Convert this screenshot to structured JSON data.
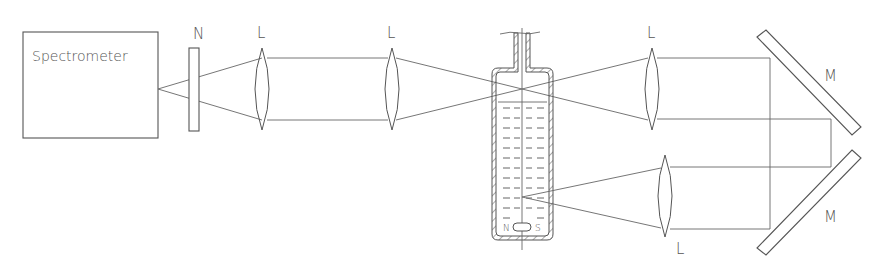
{
  "diagram": {
    "components": {
      "spectrometer": {
        "label": "Spectrometer"
      },
      "filter": {
        "label": "N"
      },
      "lens_1": {
        "label": "L"
      },
      "lens_2": {
        "label": "L"
      },
      "lens_3": {
        "label": "L"
      },
      "lens_4": {
        "label": "L"
      },
      "mirror_top": {
        "label": "M"
      },
      "mirror_bottom": {
        "label": "M"
      },
      "cell": {
        "magnet_north": "N",
        "magnet_south": "S"
      }
    },
    "colors": {
      "stroke": "#555555",
      "background": "#ffffff"
    }
  }
}
